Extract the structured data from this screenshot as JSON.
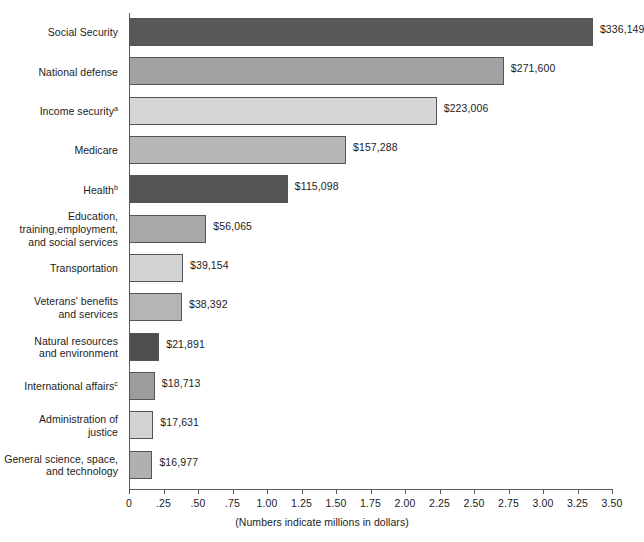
{
  "chart_data": {
    "type": "bar",
    "orientation": "horizontal",
    "title": "",
    "subtitle": "",
    "xlabel": "(Numbers indicate millions in dollars)",
    "ylabel": "",
    "xlim": [
      0,
      3.5
    ],
    "xticks": [
      "0",
      ".25",
      ".50",
      ".75",
      "1.00",
      "1.25",
      "1.50",
      "1.75",
      "2.00",
      "2.25",
      "2.50",
      "2.75",
      "3.00",
      "3.25",
      "3.50"
    ],
    "xtick_values": [
      0,
      0.25,
      0.5,
      0.75,
      1.0,
      1.25,
      1.5,
      1.75,
      2.0,
      2.25,
      2.5,
      2.75,
      3.0,
      3.25,
      3.5
    ],
    "grid": false,
    "legend": "none",
    "value_scale_note": "axis units = value / 100000",
    "categories": [
      "Social Security",
      "National defense",
      "Income security",
      "Medicare",
      "Health",
      "Education, training,employment, and social services",
      "Transportation",
      "Veterans' benefits and services",
      "Natural resources and environment",
      "International affairs",
      "Administration of justice",
      "General science, space, and technology"
    ],
    "values": [
      336149,
      271600,
      223006,
      157288,
      115098,
      56065,
      39154,
      38392,
      21891,
      18713,
      17631,
      16977
    ],
    "axis_values": [
      3.36149,
      2.716,
      2.23006,
      1.57288,
      1.15098,
      0.56065,
      0.39154,
      0.38392,
      0.21891,
      0.18713,
      0.17631,
      0.16977
    ],
    "bars": [
      {
        "label_lines": [
          "Social Security"
        ],
        "superscript": "",
        "value": 3.36149,
        "value_label": "$336,149",
        "color": "#58585a"
      },
      {
        "label_lines": [
          "National defense"
        ],
        "superscript": "",
        "value": 2.716,
        "value_label": "$271,600",
        "color": "#a2a2a4"
      },
      {
        "label_lines": [
          "Income security"
        ],
        "superscript": "a",
        "value": 2.23006,
        "value_label": "$223,006",
        "color": "#d6d6d6"
      },
      {
        "label_lines": [
          "Medicare"
        ],
        "superscript": "",
        "value": 1.57288,
        "value_label": "$157,288",
        "color": "#b7b7b9"
      },
      {
        "label_lines": [
          "Health"
        ],
        "superscript": "b",
        "value": 1.15098,
        "value_label": "$115,098",
        "color": "#555557"
      },
      {
        "label_lines": [
          "Education,",
          "training,employment,",
          "and social services"
        ],
        "superscript": "",
        "value": 0.56065,
        "value_label": "$56,065",
        "color": "#a8a8aa"
      },
      {
        "label_lines": [
          "Transportation"
        ],
        "superscript": "",
        "value": 0.39154,
        "value_label": "$39,154",
        "color": "#d3d3d3"
      },
      {
        "label_lines": [
          "Veterans' benefits",
          "and services"
        ],
        "superscript": "",
        "value": 0.38392,
        "value_label": "$38,392",
        "color": "#b5b5b7"
      },
      {
        "label_lines": [
          "Natural resources",
          "and environment"
        ],
        "superscript": "",
        "value": 0.21891,
        "value_label": "$21,891",
        "color": "#4e4e50"
      },
      {
        "label_lines": [
          "International affairs"
        ],
        "superscript": "c",
        "value": 0.18713,
        "value_label": "$18,713",
        "color": "#9d9d9f"
      },
      {
        "label_lines": [
          "Administration of",
          "justice"
        ],
        "superscript": "",
        "value": 0.17631,
        "value_label": "$17,631",
        "color": "#d2d2d2"
      },
      {
        "label_lines": [
          "General science, space,",
          "and technology"
        ],
        "superscript": "",
        "value": 0.16977,
        "value_label": "$16,977",
        "color": "#b0b0b2"
      }
    ]
  }
}
